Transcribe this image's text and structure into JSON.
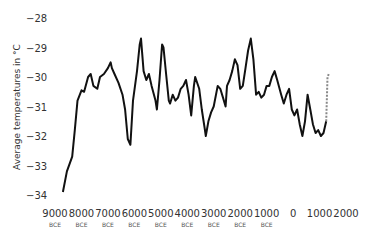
{
  "chart_data": {
    "type": "line",
    "title": "",
    "xlabel": "",
    "ylabel": "Average temperatures in °C",
    "ylim": [
      -34,
      -28
    ],
    "yticks": [
      -28,
      -29,
      -30,
      -31,
      -32,
      -33,
      -34
    ],
    "xticks": [
      {
        "year": "9000",
        "era": "BCE",
        "value": -9000
      },
      {
        "year": "8000",
        "era": "BCE",
        "value": -8000
      },
      {
        "year": "7000",
        "era": "BCE",
        "value": -7000
      },
      {
        "year": "6000",
        "era": "BCE",
        "value": -6000
      },
      {
        "year": "5000",
        "era": "BCE",
        "value": -5000
      },
      {
        "year": "4000",
        "era": "BCE",
        "value": -4000
      },
      {
        "year": "3000",
        "era": "BCE",
        "value": -3000
      },
      {
        "year": "2000",
        "era": "BCE",
        "value": -2000
      },
      {
        "year": "1000",
        "era": "BCE",
        "value": -1000
      },
      {
        "year": "0",
        "era": "",
        "value": 0
      },
      {
        "year": "1000",
        "era": "",
        "value": 1000
      },
      {
        "year": "2000",
        "era": "",
        "value": 2000
      }
    ],
    "grid": false,
    "legend": null,
    "series": [
      {
        "name": "Reconstructed temperature",
        "color": "#111111",
        "style": "solid",
        "points": [
          [
            -8700,
            -33.9
          ],
          [
            -8550,
            -33.2
          ],
          [
            -8350,
            -32.7
          ],
          [
            -8250,
            -31.8
          ],
          [
            -8150,
            -30.8
          ],
          [
            -8000,
            -30.45
          ],
          [
            -7900,
            -30.5
          ],
          [
            -7750,
            -30.0
          ],
          [
            -7650,
            -29.9
          ],
          [
            -7550,
            -30.3
          ],
          [
            -7400,
            -30.4
          ],
          [
            -7300,
            -30.0
          ],
          [
            -7150,
            -29.9
          ],
          [
            -7000,
            -29.7
          ],
          [
            -6900,
            -29.5
          ],
          [
            -6850,
            -29.7
          ],
          [
            -6750,
            -29.9
          ],
          [
            -6600,
            -30.2
          ],
          [
            -6450,
            -30.6
          ],
          [
            -6350,
            -31.1
          ],
          [
            -6250,
            -32.1
          ],
          [
            -6150,
            -32.3
          ],
          [
            -6050,
            -30.8
          ],
          [
            -5900,
            -29.8
          ],
          [
            -5800,
            -28.9
          ],
          [
            -5750,
            -28.7
          ],
          [
            -5650,
            -29.8
          ],
          [
            -5550,
            -30.1
          ],
          [
            -5450,
            -29.9
          ],
          [
            -5350,
            -30.3
          ],
          [
            -5200,
            -30.8
          ],
          [
            -5150,
            -31.1
          ],
          [
            -5050,
            -30.1
          ],
          [
            -4950,
            -28.9
          ],
          [
            -4900,
            -29.0
          ],
          [
            -4800,
            -29.9
          ],
          [
            -4700,
            -30.8
          ],
          [
            -4650,
            -30.9
          ],
          [
            -4550,
            -30.6
          ],
          [
            -4450,
            -30.8
          ],
          [
            -4350,
            -30.7
          ],
          [
            -4250,
            -30.4
          ],
          [
            -4150,
            -30.3
          ],
          [
            -4050,
            -30.1
          ],
          [
            -3950,
            -30.6
          ],
          [
            -3850,
            -31.3
          ],
          [
            -3750,
            -30.3
          ],
          [
            -3700,
            -30.0
          ],
          [
            -3550,
            -30.4
          ],
          [
            -3450,
            -31.1
          ],
          [
            -3350,
            -31.7
          ],
          [
            -3300,
            -32.0
          ],
          [
            -3200,
            -31.5
          ],
          [
            -3100,
            -31.2
          ],
          [
            -3000,
            -31.0
          ],
          [
            -2850,
            -30.3
          ],
          [
            -2750,
            -30.4
          ],
          [
            -2650,
            -30.7
          ],
          [
            -2550,
            -31.0
          ],
          [
            -2500,
            -30.3
          ],
          [
            -2400,
            -30.1
          ],
          [
            -2300,
            -29.8
          ],
          [
            -2200,
            -29.4
          ],
          [
            -2100,
            -29.6
          ],
          [
            -2000,
            -30.4
          ],
          [
            -1900,
            -30.3
          ],
          [
            -1800,
            -29.7
          ],
          [
            -1700,
            -29.1
          ],
          [
            -1600,
            -28.7
          ],
          [
            -1500,
            -29.4
          ],
          [
            -1400,
            -30.6
          ],
          [
            -1300,
            -30.5
          ],
          [
            -1200,
            -30.7
          ],
          [
            -1100,
            -30.6
          ],
          [
            -1000,
            -30.3
          ],
          [
            -900,
            -30.3
          ],
          [
            -800,
            -30.0
          ],
          [
            -700,
            -29.8
          ],
          [
            -600,
            -30.1
          ],
          [
            -450,
            -30.6
          ],
          [
            -350,
            -30.9
          ],
          [
            -250,
            -30.6
          ],
          [
            -150,
            -30.4
          ],
          [
            -50,
            -31.1
          ],
          [
            50,
            -31.3
          ],
          [
            150,
            -31.1
          ],
          [
            250,
            -31.6
          ],
          [
            350,
            -32.0
          ],
          [
            450,
            -31.5
          ],
          [
            550,
            -30.6
          ],
          [
            650,
            -31.1
          ],
          [
            750,
            -31.6
          ],
          [
            850,
            -31.9
          ],
          [
            950,
            -31.8
          ],
          [
            1050,
            -32.0
          ],
          [
            1150,
            -31.9
          ],
          [
            1250,
            -31.5
          ]
        ]
      },
      {
        "name": "Recent (dashed)",
        "color": "#888888",
        "style": "dashed",
        "points": [
          [
            1250,
            -31.5
          ],
          [
            1300,
            -30.0
          ],
          [
            1350,
            -29.9
          ]
        ]
      }
    ]
  }
}
